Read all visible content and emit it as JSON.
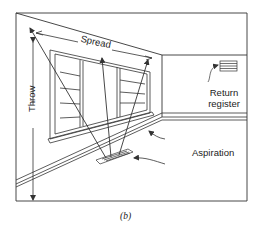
{
  "diagram": {
    "type": "room-air-distribution-illustration",
    "caption": "(b)",
    "labels": {
      "spread": "Spread",
      "throw": "Throw",
      "return_register_line1": "Return",
      "return_register_line2": "register",
      "aspiration": "Aspiration"
    },
    "elements": [
      {
        "name": "floor-diffuser",
        "description": "Floor supply register below window"
      },
      {
        "name": "return-register",
        "description": "Wall grille on right wall"
      },
      {
        "name": "window",
        "description": "Multi-pane window on left wall"
      },
      {
        "name": "throw-dimension",
        "description": "Vertical dimension arrow along left wall"
      },
      {
        "name": "spread-dimension",
        "description": "Horizontal dimension arrow along ceiling edge"
      },
      {
        "name": "aspiration-arrows",
        "description": "Curved arrows showing room air drawn toward supply jet"
      }
    ],
    "colors": {
      "line": "#333333",
      "background": "#ffffff"
    }
  }
}
